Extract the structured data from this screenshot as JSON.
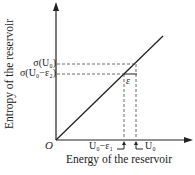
{
  "diagram": {
    "axes": {
      "y_label": "Entropy of the reservoir",
      "x_label": "Energy of the reservoir",
      "origin_label": "O"
    },
    "y_ticks": [
      {
        "label": "σ(U₀)",
        "y": 64
      },
      {
        "label": "σ(U₀−ε₂)",
        "y": 74
      }
    ],
    "x_ticks": [
      {
        "label": "U₀−ε₁",
        "x": 124
      },
      {
        "label": "U₀",
        "x": 136
      }
    ],
    "segment_label": "ε",
    "colors": {
      "line": "#222222",
      "dashed": "#444444",
      "background": "#ffffff"
    }
  }
}
